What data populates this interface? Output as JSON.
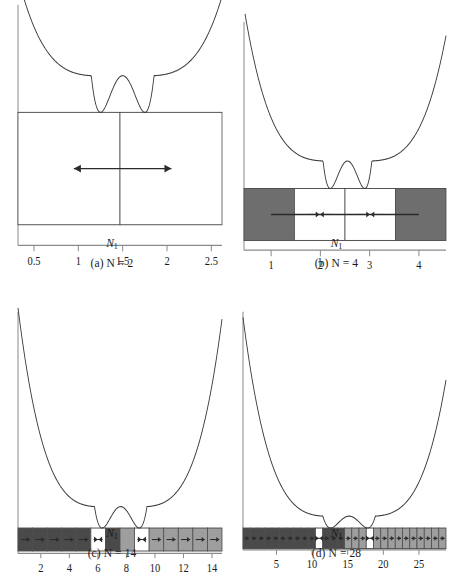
{
  "figure": {
    "colors": {
      "curve": "#3a3a3a",
      "axis": "#8a8a8a",
      "cell_border": "#4d4d4d",
      "arrow": "#2b2b2b",
      "empty_cell": "#ffffff",
      "dark_cell": "#6e6e6e",
      "darker_cell": "#4a4a4a",
      "light_cell": "#9e9e9e",
      "lighter_cell": "#b4b4b4",
      "text": "#1a1a1a"
    },
    "axis_label": "N",
    "axis_label_sub": "1"
  },
  "panels": [
    {
      "id": "a",
      "caption": "(a)  N = 2",
      "caption_prefix": "(a)",
      "caption_var": "N",
      "caption_eq": "= 2",
      "N": 2,
      "axis_label": "N",
      "axis_label_sub": "1",
      "xticks": [
        "0.5",
        "1",
        "1.5",
        "2",
        "2.5"
      ],
      "xtick_values": [
        0.5,
        1,
        1.5,
        2,
        2.5
      ],
      "xlim": [
        0.32,
        2.62
      ],
      "cells": [
        {
          "index": 1,
          "fill": "empty",
          "arrow": "none"
        },
        {
          "index": 2,
          "fill": "empty",
          "arrow": "none"
        }
      ],
      "long_arrow": {
        "from": 0.95,
        "to": 2.05,
        "heads": "both"
      },
      "well_minima": [
        1.25,
        1.75
      ],
      "barrier_center": 1.5,
      "barrier_height_rel": 0.62
    },
    {
      "id": "b",
      "caption": "(b)  N = 4",
      "caption_prefix": "(b)",
      "caption_var": "N",
      "caption_eq": "= 4",
      "N": 4,
      "axis_label": "N",
      "axis_label_sub": "1",
      "xticks": [
        "1",
        "2",
        "3",
        "4"
      ],
      "xtick_values": [
        1,
        2,
        3,
        4
      ],
      "xlim": [
        0.45,
        4.55
      ],
      "cells": [
        {
          "index": 1,
          "fill": "dark",
          "arrow": "none"
        },
        {
          "index": 2,
          "fill": "empty",
          "arrow": "converge"
        },
        {
          "index": 3,
          "fill": "empty",
          "arrow": "converge"
        },
        {
          "index": 4,
          "fill": "dark",
          "arrow": "none"
        }
      ],
      "long_arrow": {
        "from": 1.0,
        "to": 4.0,
        "heads": "none"
      },
      "well_minima": [
        2.2,
        2.9
      ],
      "barrier_center": 2.55,
      "barrier_height_rel": 0.3
    },
    {
      "id": "c",
      "caption": "(c)  N = 14",
      "caption_prefix": "(c)",
      "caption_var": "N",
      "caption_eq": "= 14",
      "N": 14,
      "axis_label": "N",
      "axis_label_sub": "1",
      "xticks": [
        "2",
        "4",
        "6",
        "8",
        "10",
        "12",
        "14"
      ],
      "xtick_values": [
        2,
        4,
        6,
        8,
        10,
        12,
        14
      ],
      "xlim": [
        0.4,
        14.7
      ],
      "cells": [
        {
          "index": 1,
          "fill": "darker",
          "arrow": "right"
        },
        {
          "index": 2,
          "fill": "darker",
          "arrow": "right"
        },
        {
          "index": 3,
          "fill": "darker",
          "arrow": "right"
        },
        {
          "index": 4,
          "fill": "darker",
          "arrow": "right"
        },
        {
          "index": 5,
          "fill": "darker",
          "arrow": "right"
        },
        {
          "index": 6,
          "fill": "empty",
          "arrow": "converge"
        },
        {
          "index": 7,
          "fill": "darker",
          "arrow": "none"
        },
        {
          "index": 8,
          "fill": "light",
          "arrow": "none"
        },
        {
          "index": 9,
          "fill": "empty",
          "arrow": "converge"
        },
        {
          "index": 10,
          "fill": "light",
          "arrow": "right"
        },
        {
          "index": 11,
          "fill": "light",
          "arrow": "right"
        },
        {
          "index": 12,
          "fill": "light",
          "arrow": "right"
        },
        {
          "index": 13,
          "fill": "light",
          "arrow": "right"
        },
        {
          "index": 14,
          "fill": "light",
          "arrow": "right"
        }
      ],
      "well_minima": [
        6.4,
        9.0
      ],
      "barrier_center": 7.6,
      "barrier_height_rel": 0.18
    },
    {
      "id": "d",
      "caption": "(d)  N = 28",
      "caption_prefix": "(d)",
      "caption_var": "N",
      "caption_eq": "= 28",
      "N": 28,
      "axis_label": "N",
      "axis_label_sub": "1",
      "xticks": [
        "5",
        "10",
        "15",
        "20",
        "25"
      ],
      "xtick_values": [
        5,
        10,
        15,
        20,
        25
      ],
      "xlim": [
        0.3,
        28.8
      ],
      "cells": [
        {
          "index": 1,
          "fill": "darker",
          "arrow": "right"
        },
        {
          "index": 2,
          "fill": "darker",
          "arrow": "right"
        },
        {
          "index": 3,
          "fill": "darker",
          "arrow": "right"
        },
        {
          "index": 4,
          "fill": "darker",
          "arrow": "right"
        },
        {
          "index": 5,
          "fill": "darker",
          "arrow": "right"
        },
        {
          "index": 6,
          "fill": "darker",
          "arrow": "right"
        },
        {
          "index": 7,
          "fill": "darker",
          "arrow": "right"
        },
        {
          "index": 8,
          "fill": "darker",
          "arrow": "right"
        },
        {
          "index": 9,
          "fill": "darker",
          "arrow": "right"
        },
        {
          "index": 10,
          "fill": "darker",
          "arrow": "right"
        },
        {
          "index": 11,
          "fill": "empty",
          "arrow": "converge"
        },
        {
          "index": 12,
          "fill": "darker",
          "arrow": "right"
        },
        {
          "index": 13,
          "fill": "darker",
          "arrow": "right"
        },
        {
          "index": 14,
          "fill": "darker",
          "arrow": "right"
        },
        {
          "index": 15,
          "fill": "light",
          "arrow": "right"
        },
        {
          "index": 16,
          "fill": "light",
          "arrow": "right"
        },
        {
          "index": 17,
          "fill": "light",
          "arrow": "right"
        },
        {
          "index": 18,
          "fill": "empty",
          "arrow": "converge"
        },
        {
          "index": 19,
          "fill": "light",
          "arrow": "right"
        },
        {
          "index": 20,
          "fill": "light",
          "arrow": "right"
        },
        {
          "index": 21,
          "fill": "light",
          "arrow": "right"
        },
        {
          "index": 22,
          "fill": "light",
          "arrow": "right"
        },
        {
          "index": 23,
          "fill": "light",
          "arrow": "right"
        },
        {
          "index": 24,
          "fill": "light",
          "arrow": "right"
        },
        {
          "index": 25,
          "fill": "light",
          "arrow": "right"
        },
        {
          "index": 26,
          "fill": "light",
          "arrow": "right"
        },
        {
          "index": 27,
          "fill": "light",
          "arrow": "right"
        },
        {
          "index": 28,
          "fill": "light",
          "arrow": "right"
        }
      ],
      "well_minima": [
        12.6,
        17.8
      ],
      "barrier_center": 15.2,
      "barrier_height_rel": 0.1
    }
  ],
  "chart_data": {
    "type": "line",
    "xlabel": "N1",
    "ylabel": "",
    "subplots": [
      {
        "label": "(a) N = 2",
        "x_ticks": [
          0.5,
          1,
          1.5,
          2,
          2.5
        ],
        "xlim": [
          0.32,
          2.62
        ],
        "minima_x": [
          1.25,
          1.75
        ],
        "barrier_x": 1.5,
        "relative_barrier_height": 0.62,
        "bar_cells": 2,
        "bar_fills": [
          "white",
          "white"
        ]
      },
      {
        "label": "(b) N = 4",
        "x_ticks": [
          1,
          2,
          3,
          4
        ],
        "xlim": [
          0.45,
          4.55
        ],
        "minima_x": [
          2.2,
          2.9
        ],
        "barrier_x": 2.55,
        "relative_barrier_height": 0.3,
        "bar_cells": 4,
        "bar_fills": [
          "dark",
          "white",
          "white",
          "dark"
        ]
      },
      {
        "label": "(c) N = 14",
        "x_ticks": [
          2,
          4,
          6,
          8,
          10,
          12,
          14
        ],
        "xlim": [
          0.4,
          14.7
        ],
        "minima_x": [
          6.4,
          9.0
        ],
        "barrier_x": 7.6,
        "relative_barrier_height": 0.18,
        "bar_cells": 14,
        "bar_fills": [
          "darker",
          "darker",
          "darker",
          "darker",
          "darker",
          "white",
          "darker",
          "light",
          "white",
          "light",
          "light",
          "light",
          "light",
          "light"
        ]
      },
      {
        "label": "(d) N = 28",
        "x_ticks": [
          5,
          10,
          15,
          20,
          25
        ],
        "xlim": [
          0.3,
          28.8
        ],
        "minima_x": [
          12.6,
          17.8
        ],
        "barrier_x": 15.2,
        "relative_barrier_height": 0.1,
        "bar_cells": 28,
        "bar_fills": [
          "darker",
          "darker",
          "darker",
          "darker",
          "darker",
          "darker",
          "darker",
          "darker",
          "darker",
          "darker",
          "white",
          "darker",
          "darker",
          "darker",
          "light",
          "light",
          "light",
          "white",
          "light",
          "light",
          "light",
          "light",
          "light",
          "light",
          "light",
          "light",
          "light",
          "light"
        ]
      }
    ],
    "grid": false,
    "legend": "none"
  }
}
